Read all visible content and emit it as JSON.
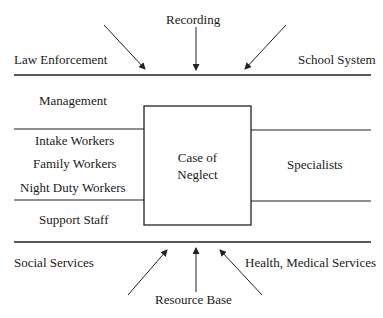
{
  "diagram": {
    "top_inputs": {
      "label": "Recording",
      "left_label": "Law Enforcement",
      "right_label": "School System"
    },
    "center_box": {
      "line1": "Case of",
      "line2": "Neglect"
    },
    "left_roles": {
      "management": "Management",
      "intake": "Intake Workers",
      "family": "Family Workers",
      "night": "Night Duty Workers",
      "support": "Support Staff"
    },
    "right_roles": {
      "specialists": "Specialists"
    },
    "bottom_inputs": {
      "label": "Resource Base",
      "left_label": "Social Services",
      "right_label": "Health, Medical Services"
    },
    "colors": {
      "line": "#222222",
      "text": "#1a1a1a",
      "background": "#ffffff"
    }
  }
}
